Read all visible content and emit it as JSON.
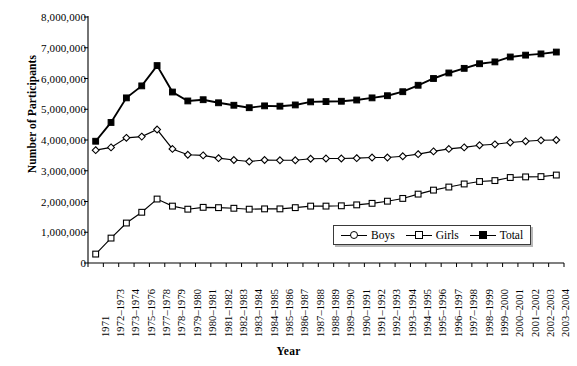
{
  "chart_data": {
    "type": "line",
    "title": "",
    "xlabel": "Year",
    "ylabel": "Number of Participants",
    "ylim": [
      0,
      8000000
    ],
    "ytick_values": [
      0,
      1000000,
      2000000,
      3000000,
      4000000,
      5000000,
      6000000,
      7000000,
      8000000
    ],
    "ytick_labels": [
      "0",
      "1,000,000",
      "2,000,000",
      "3,000,000",
      "4,000,000",
      "5,000,000",
      "6,000,000",
      "7,000,000",
      "8,000,000"
    ],
    "grid": false,
    "legend_position": "inside-lower-right",
    "categories": [
      "1971",
      "1972–1973",
      "1973–1974",
      "1975–1976",
      "1977–1978",
      "1978–1979",
      "1979–1980",
      "1980–1981",
      "1981–1982",
      "1982–1983",
      "1983–1984",
      "1984–1985",
      "1985–1986",
      "1986–1987",
      "1987–1988",
      "1988–1989",
      "1989–1990",
      "1990–1991",
      "1991–1992",
      "1992–1993",
      "1993–1994",
      "1994–1995",
      "1995–1996",
      "1996–1997",
      "1997–1998",
      "1998–1999",
      "1999–2000",
      "2000–2001",
      "2001–2002",
      "2002–2003",
      "2003–2004"
    ],
    "series": [
      {
        "name": "Boys",
        "marker": "diamond-open",
        "legend_marker": "circle-open",
        "color": "#000000",
        "values": [
          3670000,
          3760000,
          4070000,
          4110000,
          4340000,
          3710000,
          3520000,
          3500000,
          3410000,
          3350000,
          3300000,
          3350000,
          3340000,
          3340000,
          3390000,
          3400000,
          3400000,
          3410000,
          3430000,
          3430000,
          3470000,
          3540000,
          3630000,
          3710000,
          3760000,
          3830000,
          3860000,
          3920000,
          3960000,
          3990000,
          4000000
        ]
      },
      {
        "name": "Girls",
        "marker": "square-open",
        "legend_marker": "square-open",
        "color": "#000000",
        "values": [
          290000,
          810000,
          1300000,
          1650000,
          2080000,
          1850000,
          1750000,
          1810000,
          1800000,
          1780000,
          1750000,
          1760000,
          1760000,
          1800000,
          1850000,
          1850000,
          1860000,
          1890000,
          1940000,
          2010000,
          2100000,
          2240000,
          2370000,
          2470000,
          2570000,
          2650000,
          2680000,
          2780000,
          2800000,
          2810000,
          2860000
        ]
      },
      {
        "name": "Total",
        "marker": "square-filled",
        "legend_marker": "square-filled",
        "color": "#000000",
        "values": [
          3960000,
          4570000,
          5370000,
          5760000,
          6420000,
          5560000,
          5270000,
          5310000,
          5210000,
          5130000,
          5050000,
          5110000,
          5100000,
          5140000,
          5240000,
          5250000,
          5260000,
          5300000,
          5370000,
          5440000,
          5570000,
          5780000,
          6000000,
          6180000,
          6330000,
          6480000,
          6540000,
          6700000,
          6760000,
          6800000,
          6860000
        ]
      }
    ]
  },
  "axes": {
    "y_title": "Number of Participants",
    "x_title": "Year"
  },
  "legend": {
    "entries": [
      {
        "label": "Boys"
      },
      {
        "label": "Girls"
      },
      {
        "label": "Total"
      }
    ]
  }
}
